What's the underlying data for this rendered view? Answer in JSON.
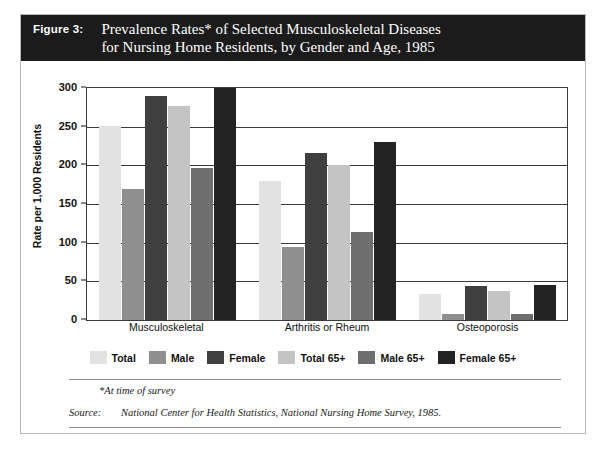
{
  "figure": {
    "label": "Figure 3:",
    "title_line1": "Prevalence Rates* of Selected Musculoskeletal Diseases",
    "title_line2": "for Nursing Home Residents, by Gender and Age, 1985",
    "header_bg": "#1b1b1b",
    "header_fg": "#ffffff"
  },
  "footnote": "*At time of survey",
  "source": {
    "label": "Source:",
    "text": "National Center for Health Statistics, National Nursing Home Survey, 1985."
  },
  "legend": [
    {
      "label": "Total",
      "color": "#e2e2e2"
    },
    {
      "label": "Male",
      "color": "#8f8f8f"
    },
    {
      "label": "Female",
      "color": "#3f3f3f"
    },
    {
      "label": "Total 65+",
      "color": "#c4c4c4"
    },
    {
      "label": "Male 65+",
      "color": "#6e6e6e"
    },
    {
      "label": "Female 65+",
      "color": "#232323"
    }
  ],
  "chart_data": {
    "type": "bar",
    "title": "Prevalence Rates* of Selected Musculoskeletal Diseases for Nursing Home Residents, by Gender and Age, 1985",
    "xlabel": "",
    "ylabel": "Rate per 1,000 Residents",
    "ylim": [
      0,
      300
    ],
    "yticks": [
      0,
      50,
      100,
      150,
      200,
      250,
      300
    ],
    "ytick_labels": [
      "0",
      "50",
      "100",
      "150",
      "200",
      "250",
      "300"
    ],
    "grid": true,
    "legend_position": "bottom",
    "categories": [
      "Musculoskeletal",
      "Arthritis or Rheum",
      "Osteoporosis"
    ],
    "series": [
      {
        "name": "Total",
        "color": "#e2e2e2",
        "values": [
          251,
          180,
          34
        ]
      },
      {
        "name": "Male",
        "color": "#8f8f8f",
        "values": [
          170,
          95,
          8
        ]
      },
      {
        "name": "Female",
        "color": "#3f3f3f",
        "values": [
          290,
          216,
          44
        ]
      },
      {
        "name": "Total 65+",
        "color": "#c4c4c4",
        "values": [
          277,
          200,
          38
        ]
      },
      {
        "name": "Male 65+",
        "color": "#6e6e6e",
        "values": [
          197,
          114,
          8
        ]
      },
      {
        "name": "Female 65+",
        "color": "#232323",
        "values": [
          300,
          230,
          45
        ]
      }
    ]
  }
}
